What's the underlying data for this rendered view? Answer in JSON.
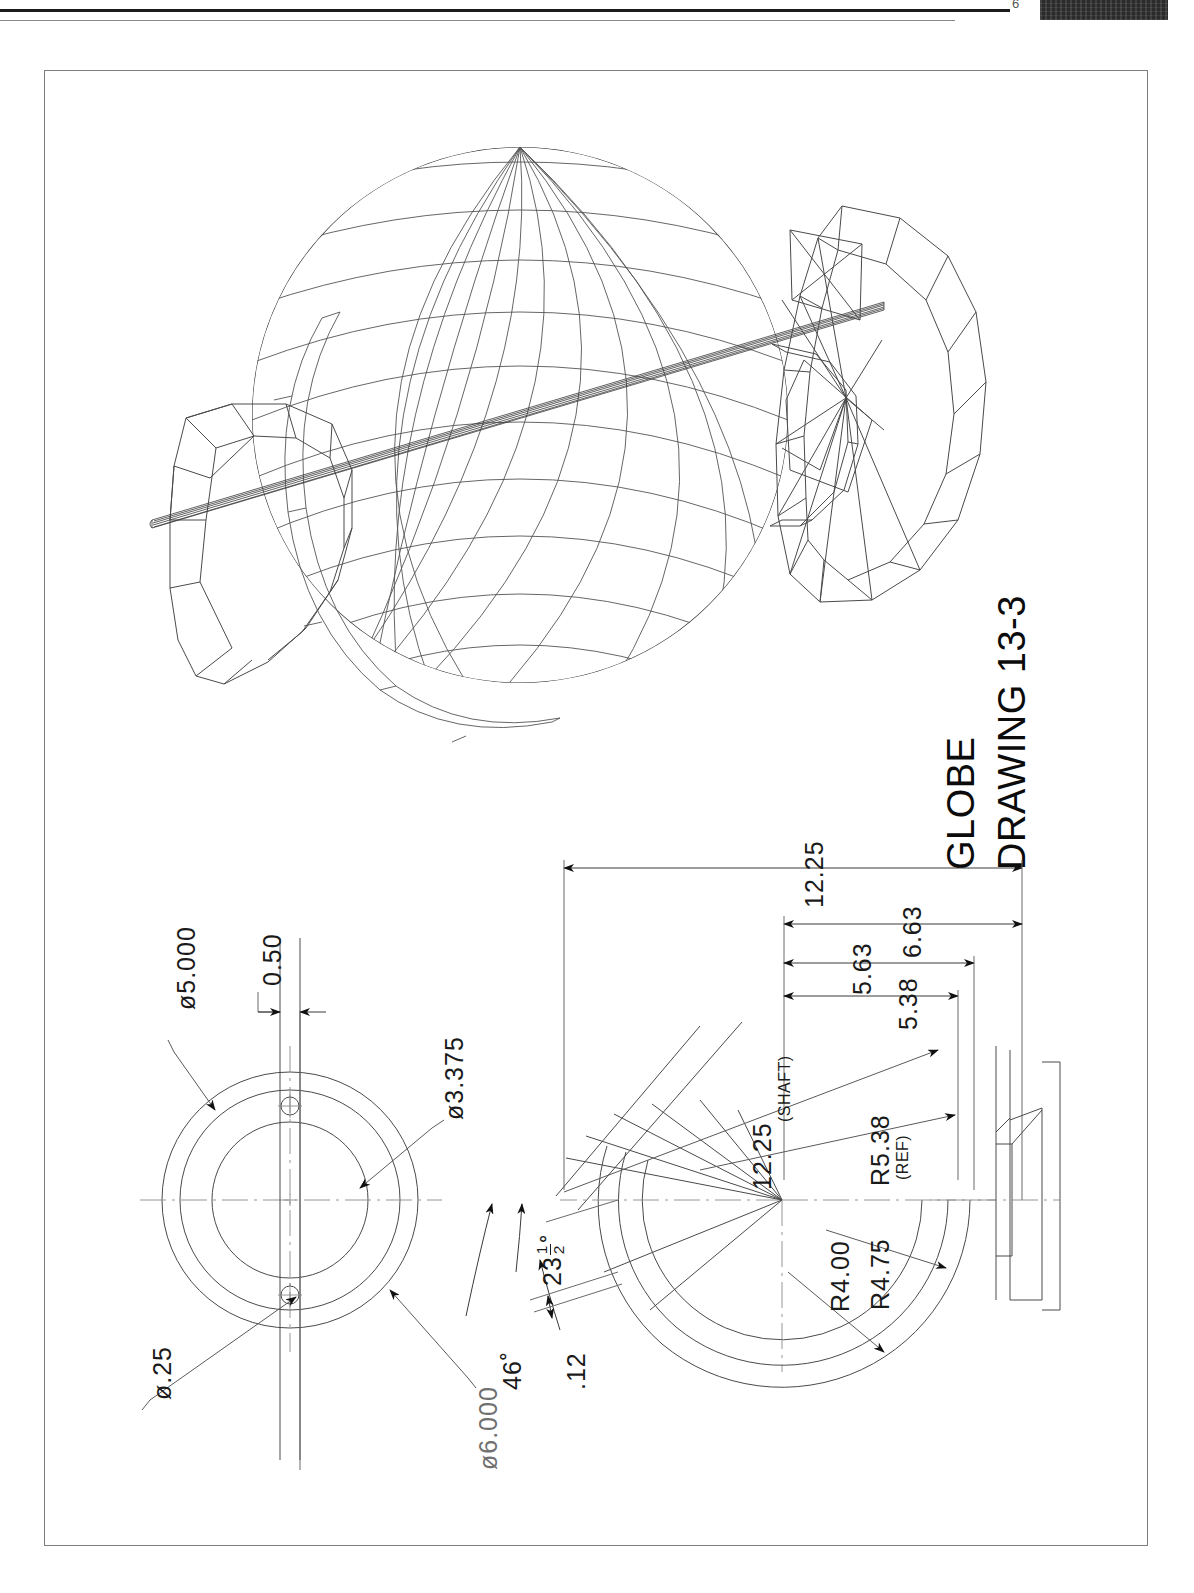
{
  "sheet": {
    "artifact_page_number": "6"
  },
  "title_block": {
    "part_name": "GLOBE",
    "drawing_label_prefix": "D",
    "drawing_label": "RAWING 13-3",
    "drawing_number": "13-3",
    "full_drawing_label": "DRAWING 13-3"
  },
  "views": {
    "pictorial": {
      "name": "isometric-wireframe-globe",
      "description": "Wireframe globe with shaft and two polygonal base discs"
    },
    "end_view": {
      "name": "end-view-circular-plate"
    },
    "section_view": {
      "name": "section-view-meridian-ring"
    }
  },
  "dimensions": {
    "end_view": [
      {
        "id": "dia-5000",
        "text": "ø5.000"
      },
      {
        "id": "dia-3375",
        "text": "ø3.375"
      },
      {
        "id": "dia-25",
        "text": "ø.25"
      },
      {
        "id": "dia-6000",
        "text": "ø6.000"
      },
      {
        "id": "width-050",
        "text": "0.50"
      }
    ],
    "section_view": [
      {
        "id": "len-1225-top",
        "text": "12.25"
      },
      {
        "id": "len-663",
        "text": "6.63"
      },
      {
        "id": "len-563",
        "text": "5.63"
      },
      {
        "id": "len-538",
        "text": "5.38"
      },
      {
        "id": "len-1225-shaft",
        "text": "12.25"
      },
      {
        "id": "note-shaft",
        "text": "(SHAFT)"
      },
      {
        "id": "rad-538",
        "text": "R5.38"
      },
      {
        "id": "note-ref",
        "text": "(REF)"
      },
      {
        "id": "rad-475",
        "text": "R4.75"
      },
      {
        "id": "rad-400",
        "text": "R4.00"
      },
      {
        "id": "ang-46",
        "text": "46˚"
      },
      {
        "id": "ang-2312-num",
        "text": "23"
      },
      {
        "id": "ang-2312-frac-n",
        "text": "1"
      },
      {
        "id": "ang-2312-frac-d",
        "text": "2"
      },
      {
        "id": "ang-2312-deg",
        "text": "˚"
      },
      {
        "id": "thk-012",
        "text": ".12"
      }
    ]
  },
  "colors": {
    "line": "#4a4a4a",
    "text": "#1a1a1a",
    "border": "#7d7d7d",
    "paper": "#ffffff"
  }
}
